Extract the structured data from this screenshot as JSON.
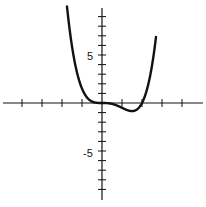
{
  "chart_data": {
    "type": "line",
    "title": "",
    "xlabel": "",
    "ylabel": "",
    "xlim": [
      -5,
      5
    ],
    "ylim": [
      -10,
      10
    ],
    "grid": false,
    "legend": null,
    "x_ticks": [
      -4,
      -3,
      -2,
      -1,
      1,
      2,
      3,
      4
    ],
    "y_ticks": [
      -9,
      -8,
      -7,
      -6,
      -5,
      -4,
      -3,
      -2,
      -1,
      1,
      2,
      3,
      4,
      5,
      6,
      7,
      8,
      9
    ],
    "y_tick_labels": [
      {
        "value": 5,
        "label": "5"
      },
      {
        "value": -5,
        "label": "-5"
      }
    ],
    "series": [
      {
        "name": "f(x)",
        "description": "quartic curve, flat at origin, local minimum near (1.4, -1.4), crosses x-axis near x=2",
        "x": [
          -1.6,
          -1.5,
          -1.25,
          -1,
          -0.75,
          -0.5,
          -0.25,
          0,
          0.25,
          0.5,
          0.75,
          1,
          1.25,
          1.5,
          1.75,
          2,
          2.25,
          2.5
        ],
        "y": [
          7.4,
          6.0,
          3.2,
          1.5,
          0.6,
          0.16,
          0.02,
          0,
          -0.01,
          -0.1,
          -0.26,
          -0.5,
          -0.73,
          -1.2,
          -0.9,
          0,
          1.9,
          4.9
        ]
      }
    ],
    "annotations": []
  },
  "axes": {
    "y_label_pos": "5",
    "y_label_neg": "-5"
  }
}
